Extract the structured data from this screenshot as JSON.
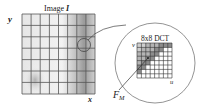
{
  "image_panel": {
    "title": "Image I",
    "title_prefix": "Image ",
    "title_var": "I",
    "y_axis_label": "y",
    "x_axis_label": "x",
    "grid_cols": 8,
    "grid_rows": 7
  },
  "zoom_panel": {
    "title": "8x8 DCT",
    "v_label": "v",
    "u_label": "u",
    "grid_size": 8
  },
  "pointer_label": {
    "main": "F",
    "subscript": "M"
  },
  "colors": {
    "grid_line": "#555555",
    "shade_dark": "#8a8a8a",
    "shade_light": "#d8d8d8",
    "background": "#ffffff"
  }
}
